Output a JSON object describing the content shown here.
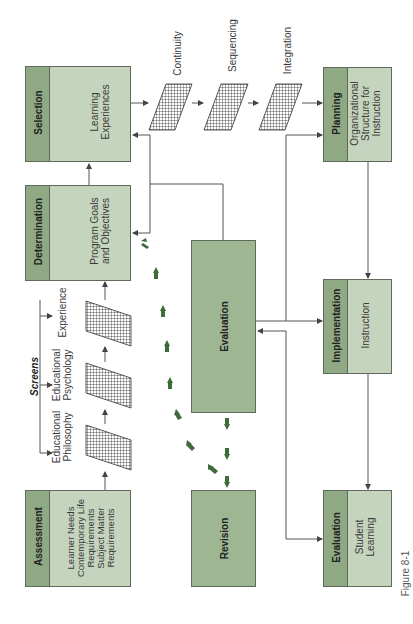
{
  "figure_label": "Figure 8-1",
  "colors": {
    "header": "#8ea983",
    "body": "#c5d4bd",
    "evaluation_center": "#9fb693",
    "green_arrow": "#3f6b3a",
    "line": "#555555"
  },
  "boxes": {
    "selection": {
      "header": "Selection",
      "body": [
        "Learning",
        "Experiences"
      ]
    },
    "determination": {
      "header": "Determination",
      "body": [
        "Program Goals",
        "and Objectives"
      ]
    },
    "assessment": {
      "header": "Assessment",
      "body": [
        "Learner Needs",
        "Contemporary Life",
        "Requirements",
        "Subject Matter",
        "Requirements"
      ]
    },
    "planning": {
      "header": "Planning",
      "body": [
        "Organizational",
        "Structure for",
        "Instruction"
      ]
    },
    "implementation": {
      "header": "Implementation",
      "body": [
        "Instruction"
      ]
    },
    "student_evaluation": {
      "header": "Evaluation",
      "body": [
        "Student",
        "Learning"
      ]
    },
    "evaluation": {
      "label": "Evaluation"
    },
    "revision": {
      "label": "Revision"
    }
  },
  "screens_title": "Screens",
  "left_screens": [
    {
      "label": [
        "Educational",
        "Philosophy"
      ]
    },
    {
      "label": [
        "Educational",
        "Psychology"
      ]
    },
    {
      "label": [
        "Experience"
      ]
    }
  ],
  "top_screens": [
    {
      "label": "Continuity"
    },
    {
      "label": "Sequencing"
    },
    {
      "label": "Integration"
    }
  ]
}
